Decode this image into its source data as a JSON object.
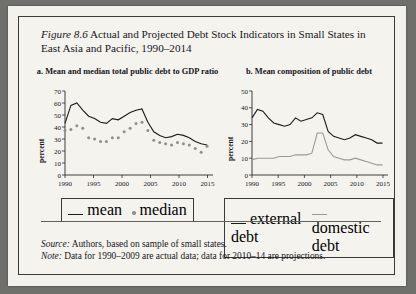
{
  "figure": {
    "number": "Figure 8.6",
    "title": "Actual and Projected Debt Stock Indicators in Small States in East Asia and Pacific, 1990–2014"
  },
  "notes": {
    "source_label": "Source:",
    "source_text": " Authors, based on sample of small states.",
    "note_label": "Note:",
    "note_text": " Data for 1990–2009 are actual data; data for 2010–14 are projections."
  },
  "chart_data": [
    {
      "type": "line",
      "panel": "a",
      "title": "a. Mean and median total public debt to GDP ratio",
      "xlabel": "",
      "ylabel": "percent",
      "xlim": [
        1990,
        2015
      ],
      "ylim": [
        0,
        70
      ],
      "yticks": [
        0,
        10,
        20,
        30,
        40,
        50,
        60,
        70
      ],
      "xticks": [
        1990,
        1995,
        2000,
        2005,
        2010,
        2015
      ],
      "grid": false,
      "legend": [
        "mean",
        "median"
      ],
      "legend_position": "bottom",
      "x": [
        1990,
        1991,
        1992,
        1993,
        1994,
        1995,
        1996,
        1997,
        1998,
        1999,
        2000,
        2001,
        2002,
        2003,
        2004,
        2005,
        2006,
        2007,
        2008,
        2009,
        2010,
        2011,
        2012,
        2013,
        2014
      ],
      "series": [
        {
          "name": "mean",
          "style": "line",
          "values": [
            43,
            58,
            60,
            54,
            49,
            47,
            44,
            43,
            47,
            46,
            49,
            52,
            54,
            55,
            44,
            36,
            33,
            31,
            32,
            34,
            33,
            31,
            28,
            26,
            25
          ]
        },
        {
          "name": "median",
          "style": "dots",
          "values": [
            37,
            38,
            41,
            39,
            31,
            30,
            28,
            28,
            31,
            31,
            36,
            39,
            43,
            44,
            37,
            29,
            27,
            26,
            25,
            27,
            26,
            25,
            22,
            19,
            24
          ]
        }
      ]
    },
    {
      "type": "line",
      "panel": "b",
      "title": "b. Mean composition of public debt",
      "xlabel": "",
      "ylabel": "percent",
      "xlim": [
        1990,
        2015
      ],
      "ylim": [
        0,
        50
      ],
      "yticks": [
        0,
        10,
        20,
        30,
        40,
        50
      ],
      "xticks": [
        1990,
        1995,
        2000,
        2005,
        2010,
        2015
      ],
      "grid": false,
      "legend": [
        "external debt",
        "domestic debt"
      ],
      "legend_position": "bottom",
      "x": [
        1990,
        1991,
        1992,
        1993,
        1994,
        1995,
        1996,
        1997,
        1998,
        1999,
        2000,
        2001,
        2002,
        2003,
        2004,
        2005,
        2006,
        2007,
        2008,
        2009,
        2010,
        2011,
        2012,
        2013,
        2014
      ],
      "series": [
        {
          "name": "external debt",
          "color": "#1b1b1b",
          "values": [
            34,
            39,
            38,
            34,
            31,
            30,
            29,
            30,
            34,
            32,
            33,
            34,
            37,
            36,
            26,
            23,
            22,
            21,
            22,
            24,
            23,
            22,
            21,
            19,
            19
          ]
        },
        {
          "name": "domestic debt",
          "color": "#9a9a98",
          "values": [
            9,
            10,
            10,
            10,
            10,
            11,
            11,
            11,
            12,
            12,
            12,
            13,
            25,
            25,
            15,
            11,
            10,
            9,
            9,
            10,
            9,
            8,
            7,
            6,
            6
          ]
        }
      ]
    }
  ]
}
